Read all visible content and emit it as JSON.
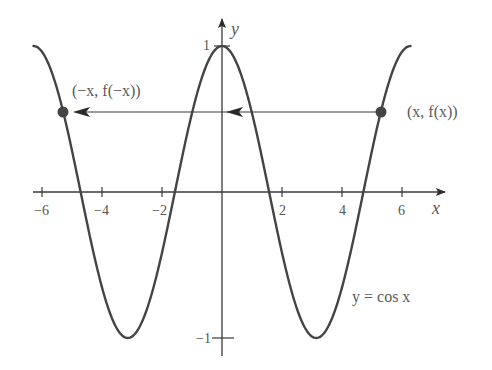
{
  "figure": {
    "title": "",
    "function_label": "y = cos x",
    "colors": {
      "curve": "#444444",
      "axes": "#3a3a3a",
      "text": "#5a5a5a",
      "point": "#444444",
      "background": "#ffffff"
    }
  },
  "axes": {
    "x_label": "x",
    "y_label": "y",
    "x_ticks": [
      {
        "value": -6,
        "label": "−6"
      },
      {
        "value": -4,
        "label": "−4"
      },
      {
        "value": -2,
        "label": "−2"
      },
      {
        "value": 2,
        "label": "2"
      },
      {
        "value": 4,
        "label": "4"
      },
      {
        "value": 6,
        "label": "6"
      }
    ],
    "y_ticks": [
      {
        "value": 1,
        "label": "1"
      },
      {
        "value": -1,
        "label": "−1"
      }
    ]
  },
  "points": {
    "left": {
      "label": "(−x, f(−x))",
      "x": -5.3,
      "y": 0.554
    },
    "right": {
      "label": "(x, f(x))",
      "x": 5.3,
      "y": 0.554
    }
  },
  "chart_data": {
    "type": "line",
    "title": "",
    "xlabel": "x",
    "ylabel": "y",
    "xlim": [
      -6.3,
      7.4
    ],
    "ylim": [
      -1.1,
      1.15
    ],
    "grid": false,
    "series": [
      {
        "name": "y = cos x",
        "function": "cos(x)",
        "domain": [
          -6.283,
          6.283
        ]
      }
    ],
    "x_ticks": [
      -6,
      -4,
      -2,
      2,
      4,
      6
    ],
    "y_ticks": [
      1,
      -1
    ],
    "annotations": [
      {
        "text": "(x, f(x))",
        "point": [
          5.3,
          0.554
        ]
      },
      {
        "text": "(−x, f(−x))",
        "point": [
          -5.3,
          0.554
        ]
      },
      {
        "text": "horizontal arrow from (x, f(x)) to (−x, f(−x)) illustrating even symmetry"
      }
    ]
  }
}
